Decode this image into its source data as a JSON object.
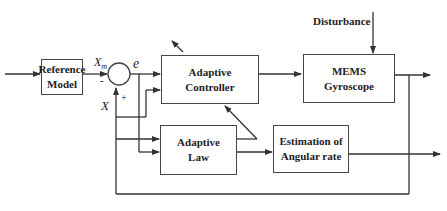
{
  "diagram": {
    "blocks": {
      "reference_model": {
        "line1": "Reference",
        "line2": "Model"
      },
      "adaptive_controller": {
        "line1": "Adaptive",
        "line2": "Controller"
      },
      "mems_gyroscope": {
        "line1": "MEMS",
        "line2": "Gyroscope"
      },
      "adaptive_law": {
        "line1": "Adaptive",
        "line2": "Law"
      },
      "estimation": {
        "line1": "Estimation of",
        "line2": "Angular rate"
      }
    },
    "labels": {
      "xm": "X",
      "xm_sub": "m",
      "minus": "-",
      "plus": "+",
      "e": "e",
      "x": "X",
      "disturbance": "Disturbance"
    },
    "colors": {
      "line": "#333333",
      "border": "#444444",
      "text": "#222222"
    }
  }
}
